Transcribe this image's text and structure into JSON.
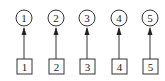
{
  "diagram": {
    "stroke_color": "#333333",
    "background": "#ffffff",
    "nodes": [
      {
        "circle_label": "1",
        "box_label": "2"
      },
      {
        "circle_label": "2",
        "box_label": "2"
      },
      {
        "circle_label": "3",
        "box_label": "3"
      },
      {
        "circle_label": "4",
        "box_label": "4"
      },
      {
        "circle_label": "5",
        "box_label": "5"
      }
    ]
  }
}
